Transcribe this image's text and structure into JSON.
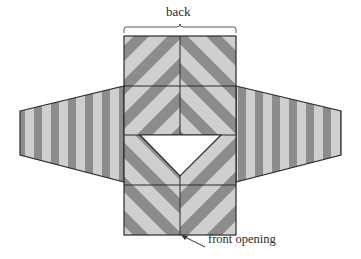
{
  "diagram": {
    "labels": {
      "back": "back",
      "front_opening": "front opening"
    },
    "colors": {
      "stripe_dark": "#8c8c8c",
      "stripe_light": "#cfcfcf",
      "outline": "#2b2b2b",
      "opening_fill": "#ffffff",
      "background": "#ffffff"
    },
    "parts": [
      {
        "name": "body-back",
        "stripe_direction": "diagonal-chevron"
      },
      {
        "name": "body-front-left",
        "stripe_direction": "diagonal"
      },
      {
        "name": "body-front-right",
        "stripe_direction": "diagonal"
      },
      {
        "name": "sleeve-left",
        "stripe_direction": "vertical"
      },
      {
        "name": "sleeve-right",
        "stripe_direction": "vertical"
      },
      {
        "name": "neck-opening",
        "shape": "triangle"
      }
    ]
  }
}
